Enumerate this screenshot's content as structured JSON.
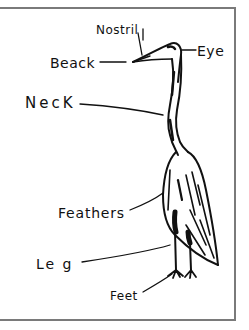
{
  "diagram": {
    "labels": {
      "nostril": "Nostril",
      "beack": "Beack",
      "eye": "Eye",
      "neck": "NecK",
      "feathers": "Feathers",
      "leg": "Le g",
      "feet": "Feet"
    },
    "colors": {
      "ink": "#111111",
      "frame": "#7a7a7a",
      "background": "#ffffff"
    }
  }
}
